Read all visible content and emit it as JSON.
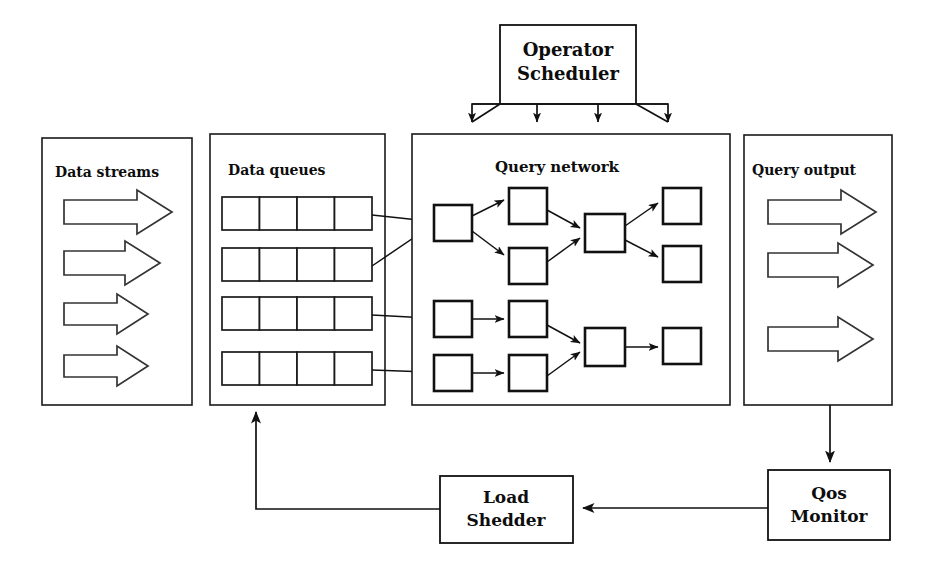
{
  "diagram": {
    "background_color": "#ffffff",
    "line_color": "#111111",
    "panels": [
      {
        "id": "data-streams",
        "label": "Data streams",
        "x": 42,
        "y": 138,
        "w": 150,
        "h": 267,
        "arrow_count": 4,
        "arrow_widths": [
          108,
          96,
          84,
          84
        ]
      },
      {
        "id": "data-queues",
        "label": "Data queues",
        "x": 210,
        "y": 134,
        "w": 175,
        "h": 271,
        "queue_count": 4,
        "cells_per_queue": 4
      },
      {
        "id": "query-network",
        "label": "Query network",
        "x": 412,
        "y": 134,
        "w": 318,
        "h": 271,
        "operator_count": 12
      },
      {
        "id": "query-output",
        "label": "Query output",
        "x": 744,
        "y": 135,
        "w": 148,
        "h": 270,
        "arrow_count": 3,
        "arrow_widths": [
          108,
          104,
          104
        ]
      }
    ],
    "processes": [
      {
        "id": "operator-scheduler",
        "label_line_1": "Operator",
        "label_line_2": "Scheduler",
        "x": 500,
        "y": 25,
        "w": 136,
        "h": 79
      },
      {
        "id": "load-shedder",
        "label_line_1": "Load",
        "label_line_2": "Shedder",
        "x": 440,
        "y": 476,
        "w": 133,
        "h": 67
      },
      {
        "id": "qos-monitor",
        "label_line_1": "Qos",
        "label_line_2": "Monitor",
        "x": 768,
        "y": 470,
        "w": 122,
        "h": 70
      }
    ],
    "scheduler_control_arrows": {
      "count": 4,
      "target_label": "query-network",
      "x_positions": [
        472,
        537,
        598,
        668
      ]
    },
    "feedback_edges": [
      {
        "from": "query-output",
        "to": "qos-monitor",
        "direction": "down"
      },
      {
        "from": "qos-monitor",
        "to": "load-shedder",
        "direction": "left"
      },
      {
        "from": "load-shedder",
        "to": "data-queues",
        "direction": "up-left"
      }
    ],
    "queue_to_operator_edges": [
      {
        "queue": 1,
        "operator": "op-a",
        "style": "diagonal"
      },
      {
        "queue": 2,
        "operator": "op-a",
        "style": "diagonal"
      },
      {
        "queue": 3,
        "operator": "op-e",
        "style": "straight"
      },
      {
        "queue": 4,
        "operator": "op-f",
        "style": "straight"
      }
    ],
    "operators": [
      {
        "id": "op-a",
        "x": 434,
        "y": 205,
        "w": 38,
        "h": 36
      },
      {
        "id": "op-b",
        "x": 509,
        "y": 188,
        "w": 38,
        "h": 36
      },
      {
        "id": "op-c",
        "x": 509,
        "y": 248,
        "w": 38,
        "h": 36
      },
      {
        "id": "op-d",
        "x": 585,
        "y": 214,
        "w": 40,
        "h": 38
      },
      {
        "id": "op-g",
        "x": 663,
        "y": 188,
        "w": 38,
        "h": 36
      },
      {
        "id": "op-h",
        "x": 663,
        "y": 246,
        "w": 38,
        "h": 36
      },
      {
        "id": "op-e",
        "x": 434,
        "y": 301,
        "w": 38,
        "h": 36
      },
      {
        "id": "op-f",
        "x": 434,
        "y": 355,
        "w": 38,
        "h": 36
      },
      {
        "id": "op-i",
        "x": 509,
        "y": 301,
        "w": 38,
        "h": 36
      },
      {
        "id": "op-j",
        "x": 509,
        "y": 355,
        "w": 38,
        "h": 36
      },
      {
        "id": "op-k",
        "x": 585,
        "y": 328,
        "w": 40,
        "h": 38
      },
      {
        "id": "op-l",
        "x": 663,
        "y": 328,
        "w": 38,
        "h": 36
      }
    ],
    "operator_edges": [
      {
        "from": "op-a",
        "to": "op-b"
      },
      {
        "from": "op-a",
        "to": "op-c"
      },
      {
        "from": "op-b",
        "to": "op-d"
      },
      {
        "from": "op-c",
        "to": "op-d"
      },
      {
        "from": "op-d",
        "to": "op-g"
      },
      {
        "from": "op-d",
        "to": "op-h"
      },
      {
        "from": "op-e",
        "to": "op-i"
      },
      {
        "from": "op-f",
        "to": "op-j"
      },
      {
        "from": "op-i",
        "to": "op-k"
      },
      {
        "from": "op-j",
        "to": "op-k"
      },
      {
        "from": "op-k",
        "to": "op-l"
      }
    ]
  }
}
